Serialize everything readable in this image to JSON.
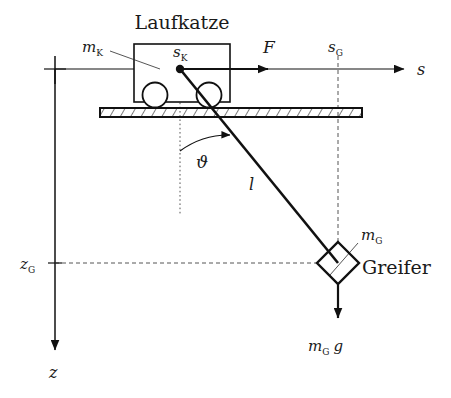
{
  "figure": {
    "background_color": "#ffffff",
    "line_color": "#111111",
    "dash_color": "#555555"
  },
  "labels": {
    "trolley_title": "Laufkatze",
    "trolley_mass": "m",
    "trolley_mass_sub": "K",
    "trolley_position": "s",
    "trolley_position_sub": "K",
    "force": "F",
    "grab_position": "s",
    "grab_position_sub": "G",
    "s_axis": "s",
    "z_axis": "z",
    "grab_height": "z",
    "grab_height_sub": "G",
    "rope_length": "l",
    "angle": "ϑ",
    "grab_mass": "m",
    "grab_mass_sub": "G",
    "grab_name": "Greifer",
    "weight_force": "m",
    "weight_force_sub": "G",
    "weight_force_g": "g"
  },
  "geometry": {
    "origin": {
      "x": 55,
      "y": 69
    },
    "s_axis": {
      "x1": 55,
      "y1": 69,
      "x2": 408,
      "y2": 69
    },
    "z_axis": {
      "x1": 55,
      "y1": 69,
      "x2": 55,
      "y2": 355
    },
    "force_arrow": {
      "x1": 181,
      "y1": 69,
      "x2": 277,
      "y2": 69
    },
    "trolley_box": {
      "x": 134,
      "y": 44,
      "width": 96,
      "height": 58
    },
    "wheel_left": {
      "cx": 155,
      "cy": 95,
      "r": 12
    },
    "wheel_right": {
      "cx": 209,
      "cy": 95,
      "r": 12
    },
    "rail": {
      "x": 100,
      "y": 108,
      "width": 262,
      "height": 9
    },
    "pivot": {
      "x": 180,
      "y": 69,
      "r": 4
    },
    "rope": {
      "x1": 180,
      "y1": 69,
      "x2": 338,
      "y2": 263
    },
    "grab_diamond": {
      "cx": 338,
      "cy": 263,
      "half": 21
    },
    "weight_arrow": {
      "x1": 338,
      "y1": 284,
      "x2": 338,
      "y2": 327
    },
    "angle_arc": {
      "cx": 180,
      "cy": 69,
      "radius": 82,
      "start_deg": 90,
      "end_deg": 50.8
    },
    "vertical_dotted": {
      "x": 180,
      "y1": 69,
      "y2": 215
    },
    "grab_vertical_dashed": {
      "x": 338,
      "y1": 56,
      "y2": 242
    },
    "grab_horizontal_dashed": {
      "y": 263,
      "x1": 55,
      "x2": 317
    }
  },
  "label_positions": {
    "trolley_title": {
      "x": 182,
      "y": 28
    },
    "trolley_mass": {
      "x": 88,
      "y": 50
    },
    "trolley_position": {
      "x": 175,
      "y": 55
    },
    "force": {
      "x": 266,
      "y": 50
    },
    "grab_position": {
      "x": 331,
      "y": 50
    },
    "s_axis": {
      "x": 420,
      "y": 73
    },
    "angle": {
      "x": 200,
      "y": 163
    },
    "rope_length": {
      "x": 252,
      "y": 185
    },
    "grab_height": {
      "x": 25,
      "y": 267
    },
    "z_axis": {
      "x": 52,
      "y": 375
    },
    "grab_mass": {
      "x": 362,
      "y": 238
    },
    "grab_name": {
      "x": 364,
      "y": 272
    },
    "weight_force": {
      "x": 314,
      "y": 348
    }
  }
}
